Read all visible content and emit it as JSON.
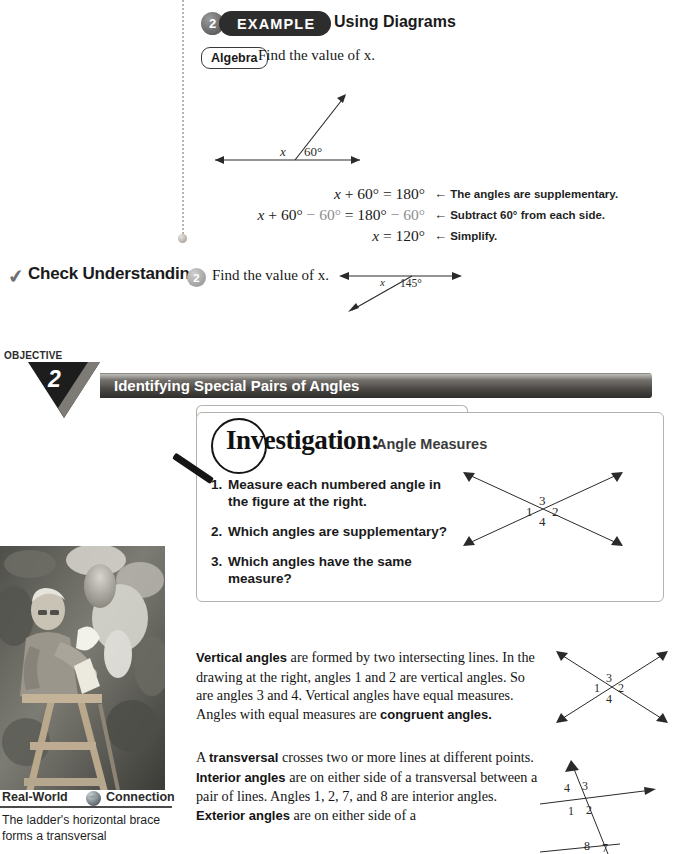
{
  "example": {
    "number": "2",
    "badge": "EXAMPLE",
    "title": "Using Diagrams",
    "algebra_tag": "Algebra",
    "prompt": "Find the value of x.",
    "diagram": {
      "angle_label": "60°",
      "unknown_label": "x"
    },
    "steps": [
      {
        "equation_left": "x + 60°",
        "equation_rel": "=",
        "equation_right": "180°",
        "note": "The angles are supplementary."
      },
      {
        "equation_left": "x + 60° − 60°",
        "equation_rel": "=",
        "equation_right": "180° − 60°",
        "note": "Subtract 60° from each side."
      },
      {
        "equation_left": "x",
        "equation_rel": "=",
        "equation_right": "120°",
        "note": "Simplify."
      }
    ],
    "arrow_glyph": "←"
  },
  "check_understanding": {
    "label": "Check Understanding",
    "number": "2",
    "text": "Find the value of x.",
    "diagram": {
      "angle_label": "145°",
      "unknown_label": "x"
    },
    "check_glyph": "✔"
  },
  "objective": {
    "kicker": "OBJECTIVE",
    "number": "2",
    "title": "Identifying Special Pairs of Angles"
  },
  "investigation": {
    "heading": "Investigation:",
    "subheading": "Angle Measures",
    "items": [
      {
        "number": "1.",
        "text": "Measure each numbered angle in the figure at the right."
      },
      {
        "number": "2.",
        "text": "Which angles are supplementary?"
      },
      {
        "number": "3.",
        "text": "Which angles have the same measure?"
      }
    ],
    "diagram_labels": {
      "left": "1",
      "top": "3",
      "right": "2",
      "bottom": "4"
    }
  },
  "body": {
    "paragraph1": {
      "term": "Vertical angles",
      "rest_a": " are formed by two intersecting lines. In the drawing at the right, angles 1 and 2 are vertical angles. So are angles 3 and 4. Vertical angles have equal measures. Angles with equal measures are ",
      "term2": "congruent angles.",
      "diagram_labels": {
        "left": "1",
        "top": "3",
        "right": "2",
        "bottom": "4"
      }
    },
    "paragraph2": {
      "lead": "A ",
      "term": "transversal",
      "rest_a": " crosses two or more lines at different points. ",
      "term2": "Interior angles",
      "rest_b": " are on either side of a transversal between a pair of lines. Angles 1, 2, 7, and 8 are interior angles. ",
      "term3": "Exterior angles",
      "rest_c": " are on either side of a",
      "diagram_labels": {
        "upper_left": "4",
        "upper_right": "3",
        "lower_left": "1",
        "lower_right": "2",
        "second_left": "8",
        "second_right": "7"
      }
    }
  },
  "real_world": {
    "title_left": "Real-World",
    "title_right": "Connection",
    "caption": "The ladder's horizontal brace forms a transversal"
  }
}
